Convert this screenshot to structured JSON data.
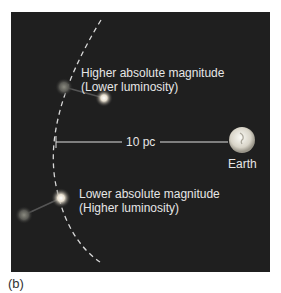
{
  "figure": {
    "panel_label": "(b)",
    "upper_star": {
      "line1": "Higher absolute magnitude",
      "line2": "(Lower luminosity)"
    },
    "lower_star": {
      "line1": "Lower absolute magnitude",
      "line2": "(Higher luminosity)"
    },
    "distance_label": "10 pc",
    "earth_label": "Earth",
    "colors": {
      "background": "#1f1f1f",
      "text": "#e6e6e6",
      "arc": "#d8d8d8"
    }
  }
}
